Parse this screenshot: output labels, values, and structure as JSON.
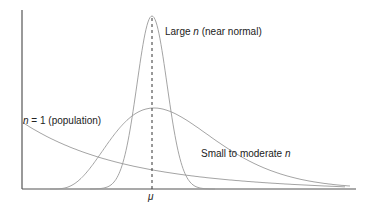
{
  "chart_data": {
    "type": "line",
    "title": "",
    "xlabel": "",
    "ylabel": "",
    "x_tick_labels": [
      "μ"
    ],
    "mean_marker": "μ",
    "series": [
      {
        "name": "n = 1 (population)",
        "label_var": "n",
        "label_rest": " = 1 (population)",
        "shape": "right-skewed decaying (exponential-like)"
      },
      {
        "name": "Small to moderate n",
        "label_prefix": "Small to moderate ",
        "label_var": "n",
        "shape": "right-skewed unimodal, peak slightly left of μ"
      },
      {
        "name": "Large n (near normal)",
        "label_prefix": "Large ",
        "label_var": "n",
        "label_rest": " (near normal)",
        "shape": "narrow symmetric normal centered at μ"
      }
    ],
    "grid": false,
    "legend": "inline labels"
  }
}
